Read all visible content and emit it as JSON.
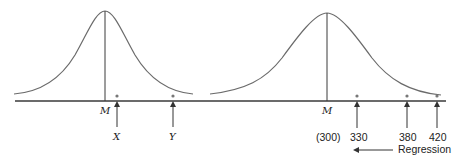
{
  "diagram": {
    "left_panel": {
      "mean_label": "M",
      "markers": [
        {
          "label": "X"
        },
        {
          "label": "Y"
        }
      ]
    },
    "right_panel": {
      "mean_label": "M",
      "mean_value": "(300)",
      "markers": [
        {
          "label": "330"
        },
        {
          "label": "380"
        },
        {
          "label": "420"
        }
      ],
      "arrow_label": "Regression"
    },
    "colors": {
      "curve": "#6b6b6b",
      "axis": "#3a3a3a",
      "dot": "#777777",
      "text": "#222222"
    }
  }
}
